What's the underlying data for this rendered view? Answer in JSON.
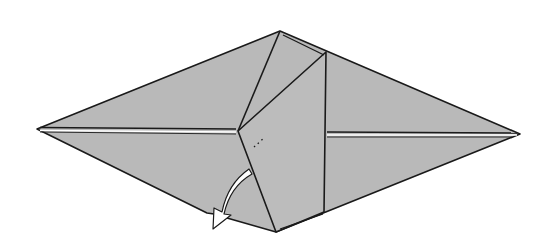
{
  "diagram": {
    "type": "origami-fold-diagram",
    "colors": {
      "paper_fill": "#b9b9b9",
      "line": "#1a1a1a",
      "background": "#ffffff",
      "arrow_fill": "#ffffff"
    },
    "vertices": {
      "left": [
        37,
        129
      ],
      "top": [
        280,
        31
      ],
      "right": [
        520,
        134
      ],
      "bottom": [
        276,
        232
      ],
      "center": [
        238,
        131
      ],
      "flap_top_right": [
        326,
        52
      ],
      "flap_bottom_right": [
        323,
        212
      ]
    },
    "arrow": {
      "style": "hollow-curved",
      "direction": "down-left",
      "tip": [
        213,
        228
      ]
    },
    "labels": []
  }
}
